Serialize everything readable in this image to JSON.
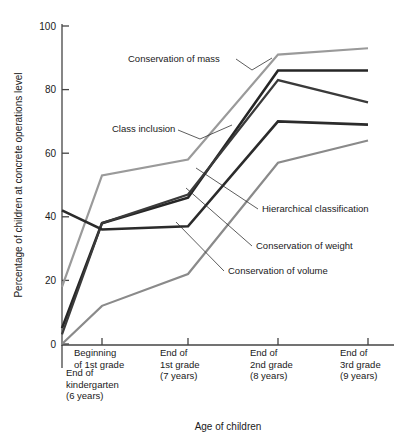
{
  "chart_data": {
    "type": "line",
    "title": "",
    "xlabel": "Age of children",
    "ylabel": "Percentage of children at concrete operations level",
    "ylim": [
      0,
      100
    ],
    "yticks": [
      0,
      20,
      40,
      60,
      80,
      100
    ],
    "ytick_labels": [
      "0",
      "20",
      "40",
      "60",
      "80",
      "100"
    ],
    "grid": false,
    "legend": "annotations-with-leader-lines",
    "categories": [
      "End of kindergarten (6 years)",
      "Beginning of 1st grade",
      "End of 1st grade (7 years)",
      "End of 2nd grade (8 years)",
      "End of 3rd grade (9 years)"
    ],
    "category_lines": [
      [
        "End of",
        "kindergarten",
        "(6 years)"
      ],
      [
        "Beginning",
        "of 1st grade"
      ],
      [
        "End of",
        "1st grade",
        "(7 years)"
      ],
      [
        "End of",
        "2nd grade",
        "(8 years)"
      ],
      [
        "End of",
        "3rd grade",
        "(9 years)"
      ]
    ],
    "series": [
      {
        "name": "Conservation of mass",
        "color": "#9a9a9a",
        "width": 2.2,
        "values": [
          18,
          53,
          58,
          91,
          93
        ]
      },
      {
        "name": "Class inclusion",
        "color": "#262626",
        "width": 2.6,
        "values": [
          5,
          38,
          46,
          86,
          86
        ]
      },
      {
        "name": "Hierarchical classification",
        "color": "#3a3a3a",
        "width": 2.2,
        "values": [
          3,
          38,
          47,
          83,
          76
        ]
      },
      {
        "name": "Conservation of weight",
        "color": "#2b2b2b",
        "width": 2.6,
        "values": [
          42,
          36,
          37,
          70,
          69
        ]
      },
      {
        "name": "Conservation of volume",
        "color": "#8a8a8a",
        "width": 2.2,
        "values": [
          0,
          12,
          22,
          57,
          64
        ]
      }
    ],
    "annotations": [
      {
        "label": "Conservation of mass",
        "text_x": 128,
        "text_y": 62,
        "anchor": "start",
        "leader": "M 236 59 L 252 70 L 272 58"
      },
      {
        "label": "Class inclusion",
        "text_x": 112,
        "text_y": 132,
        "anchor": "start",
        "leader": "M 178 130 L 200 139 L 232 125"
      },
      {
        "label": "Hierarchical classification",
        "text_x": 262,
        "text_y": 212,
        "anchor": "start",
        "leader": "M 258 209 L 196 168"
      },
      {
        "label": "Conservation of weight",
        "text_x": 256,
        "text_y": 249,
        "anchor": "start",
        "leader": "M 252 246 L 186 188"
      },
      {
        "label": "Conservation of volume",
        "text_x": 228,
        "text_y": 274,
        "anchor": "start",
        "leader": "M 224 271 L 176 222"
      }
    ]
  },
  "axis": {
    "x_title": "Age of children",
    "y_title": "Percentage of children at concrete operations level"
  }
}
